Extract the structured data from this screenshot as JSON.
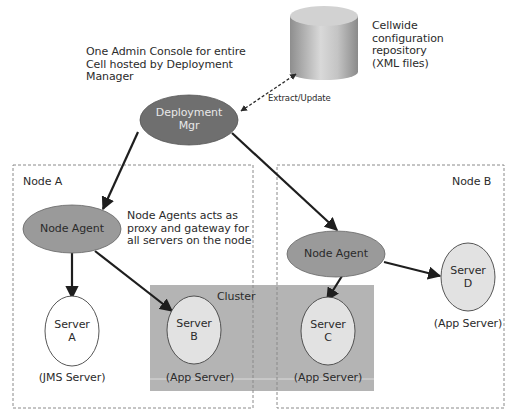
{
  "annotations": {
    "admin_console_note": [
      "One Admin Console for entire",
      "Cell hosted by Deployment",
      "Manager"
    ],
    "repository_note": [
      "Cellwide",
      "configuration",
      "repository",
      "(XML files)"
    ],
    "extract_update": "Extract/Update",
    "node_agent_note": [
      "Node Agents acts as",
      "proxy and gateway for",
      "all servers on the node"
    ]
  },
  "nodes": {
    "deployment_mgr": {
      "label_line1": "Deployment",
      "label_line2": "Mgr",
      "fill": "#6f6f6f"
    },
    "node_a": {
      "title": "Node A",
      "agent_label": "Node Agent",
      "servers": [
        {
          "label_line1": "Server",
          "label_line2": "A",
          "role": "(JMS Server)",
          "fill": "#ffffff"
        },
        {
          "label_line1": "Server",
          "label_line2": "B",
          "role": "(App Server)",
          "fill": "#e2e2e2"
        }
      ]
    },
    "node_b": {
      "title": "Node B",
      "agent_label": "Node Agent",
      "servers": [
        {
          "label_line1": "Server",
          "label_line2": "C",
          "role": "(App Server)",
          "fill": "#e2e2e2"
        },
        {
          "label_line1": "Server",
          "label_line2": "D",
          "role": "(App Server)",
          "fill": "#e2e2e2"
        }
      ]
    },
    "cluster": {
      "label": "Cluster",
      "fill": "#b4b4b4"
    }
  },
  "colors": {
    "agent_fill": "#9a9a9a",
    "arrow": "#1e1e1e",
    "dashed_border": "#8a8a8a"
  }
}
